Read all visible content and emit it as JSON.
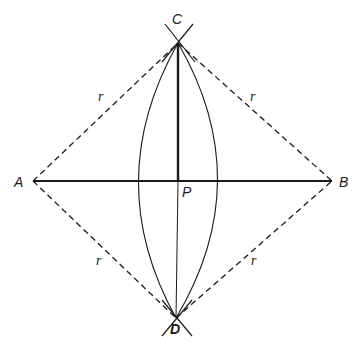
{
  "diagram": {
    "type": "geometric-construction",
    "points": {
      "A": {
        "label": "A",
        "x": 33,
        "y": 181
      },
      "B": {
        "label": "B",
        "x": 332,
        "y": 181
      },
      "C": {
        "label": "C",
        "x": 178,
        "y": 43
      },
      "D": {
        "label": "D",
        "x": 176,
        "y": 318
      },
      "P": {
        "label": "P",
        "x": 178,
        "y": 181
      }
    },
    "segments": [
      {
        "from": "A",
        "to": "B",
        "style": "solid-thick"
      },
      {
        "from": "C",
        "to": "P",
        "style": "solid-thick"
      },
      {
        "from": "P",
        "to": "D",
        "style": "solid-thin"
      },
      {
        "from": "A",
        "to": "C",
        "style": "dashed",
        "label": "r"
      },
      {
        "from": "C",
        "to": "B",
        "style": "dashed",
        "label": "r"
      },
      {
        "from": "A",
        "to": "D",
        "style": "dashed",
        "label": "r"
      },
      {
        "from": "D",
        "to": "B",
        "style": "dashed",
        "label": "r"
      }
    ],
    "arcs": [
      {
        "center": "B",
        "through": [
          "C",
          "D"
        ],
        "crosses_AB_x": 129
      },
      {
        "center": "A",
        "through": [
          "C",
          "D"
        ],
        "crosses_AB_x": 228
      }
    ],
    "labels": {
      "A": "A",
      "B": "B",
      "C": "C",
      "D": "D",
      "P": "P",
      "r_upper_left": "r",
      "r_upper_right": "r",
      "r_lower_left": "r",
      "r_lower_right": "r"
    },
    "colors": {
      "ink": "#1a1a1a",
      "background": "#ffffff"
    }
  }
}
